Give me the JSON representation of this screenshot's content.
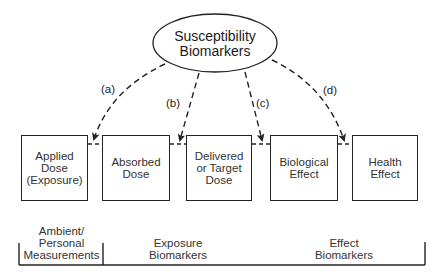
{
  "diagram": {
    "center_node": {
      "lines": [
        "Susceptibility",
        "Biomarkers"
      ]
    },
    "arrow_labels": [
      "(a)",
      "(b)",
      "(c)",
      "(d)"
    ],
    "boxes": [
      {
        "lines": [
          "Applied",
          "Dose",
          "(Exposure)"
        ]
      },
      {
        "lines": [
          "Absorbed",
          "Dose"
        ]
      },
      {
        "lines": [
          "Delivered",
          "or Target",
          "Dose"
        ]
      },
      {
        "lines": [
          "Biological",
          "Effect"
        ]
      },
      {
        "lines": [
          "Health",
          "Effect"
        ]
      }
    ],
    "categories": [
      {
        "lines": [
          "Ambient/",
          "Personal",
          "Measurements"
        ]
      },
      {
        "lines": [
          "Exposure",
          "Biomarkers"
        ]
      },
      {
        "lines": [
          "Effect",
          "Biomarkers"
        ]
      }
    ],
    "colors": {
      "stroke": "#222222",
      "background": "#ffffff"
    }
  }
}
